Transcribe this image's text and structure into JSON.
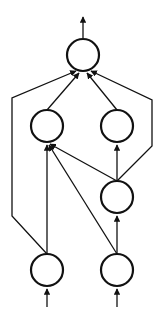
{
  "diagram": {
    "type": "directed-graph",
    "colors": {
      "stroke": "#111111",
      "background": "#ffffff",
      "node_fill": "#ffffff"
    },
    "node_radius": 16,
    "nodes": [
      {
        "id": "top",
        "cx": 83,
        "cy": 55
      },
      {
        "id": "mid-left",
        "cx": 47,
        "cy": 126
      },
      {
        "id": "mid-right",
        "cx": 117,
        "cy": 126
      },
      {
        "id": "lower-right",
        "cx": 117,
        "cy": 197
      },
      {
        "id": "bottom-left",
        "cx": 47,
        "cy": 270
      },
      {
        "id": "bottom-right",
        "cx": 117,
        "cy": 270
      }
    ],
    "edges": [
      {
        "from": "output",
        "points": "83,38 83,17"
      },
      {
        "from": "input-left",
        "points": "47,307 47,289"
      },
      {
        "from": "input-right",
        "points": "117,307 117,289"
      },
      {
        "from": "bottom-left",
        "to": "mid-left",
        "points": "47,254 47,145"
      },
      {
        "from": "bottom-left",
        "to": "top",
        "points": "47,254 12,216 12,98 76,71"
      },
      {
        "from": "bottom-right",
        "to": "lower-right",
        "points": "117,254 117,216"
      },
      {
        "from": "bottom-right",
        "to": "mid-left",
        "points": "117,254 49,145"
      },
      {
        "from": "lower-right",
        "to": "mid-left",
        "points": "117,181 50,144"
      },
      {
        "from": "lower-right",
        "to": "mid-right",
        "points": "117,181 117,145"
      },
      {
        "from": "lower-right",
        "to": "top",
        "points": "117,181 152,146 152,100 91,71"
      },
      {
        "from": "mid-left",
        "to": "top",
        "points": "47,110 79,73"
      },
      {
        "from": "mid-right",
        "to": "top",
        "points": "117,110 87,73"
      }
    ]
  }
}
